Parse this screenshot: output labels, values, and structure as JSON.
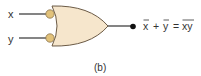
{
  "diagram": {
    "type": "logic-gate",
    "gate": "OR gate with inverted (bubbled) inputs (equivalent to NAND)",
    "inputs": [
      {
        "label": "x",
        "inverted": true
      },
      {
        "label": "y",
        "inverted": true
      }
    ],
    "output": {
      "expression_left_terms": [
        "x",
        "y"
      ],
      "operator": "+",
      "equals": "=",
      "expression_right": "xy",
      "text": "x̄ + ȳ = x̄ȳ̄ (overbar on whole xy)"
    },
    "caption": "(b)",
    "colors": {
      "gate_fill": "#f6e6cc",
      "gate_stroke": "#6b5a45",
      "bubble_fill": "#e2c27a",
      "wire": "#333333",
      "text": "#333333"
    }
  }
}
